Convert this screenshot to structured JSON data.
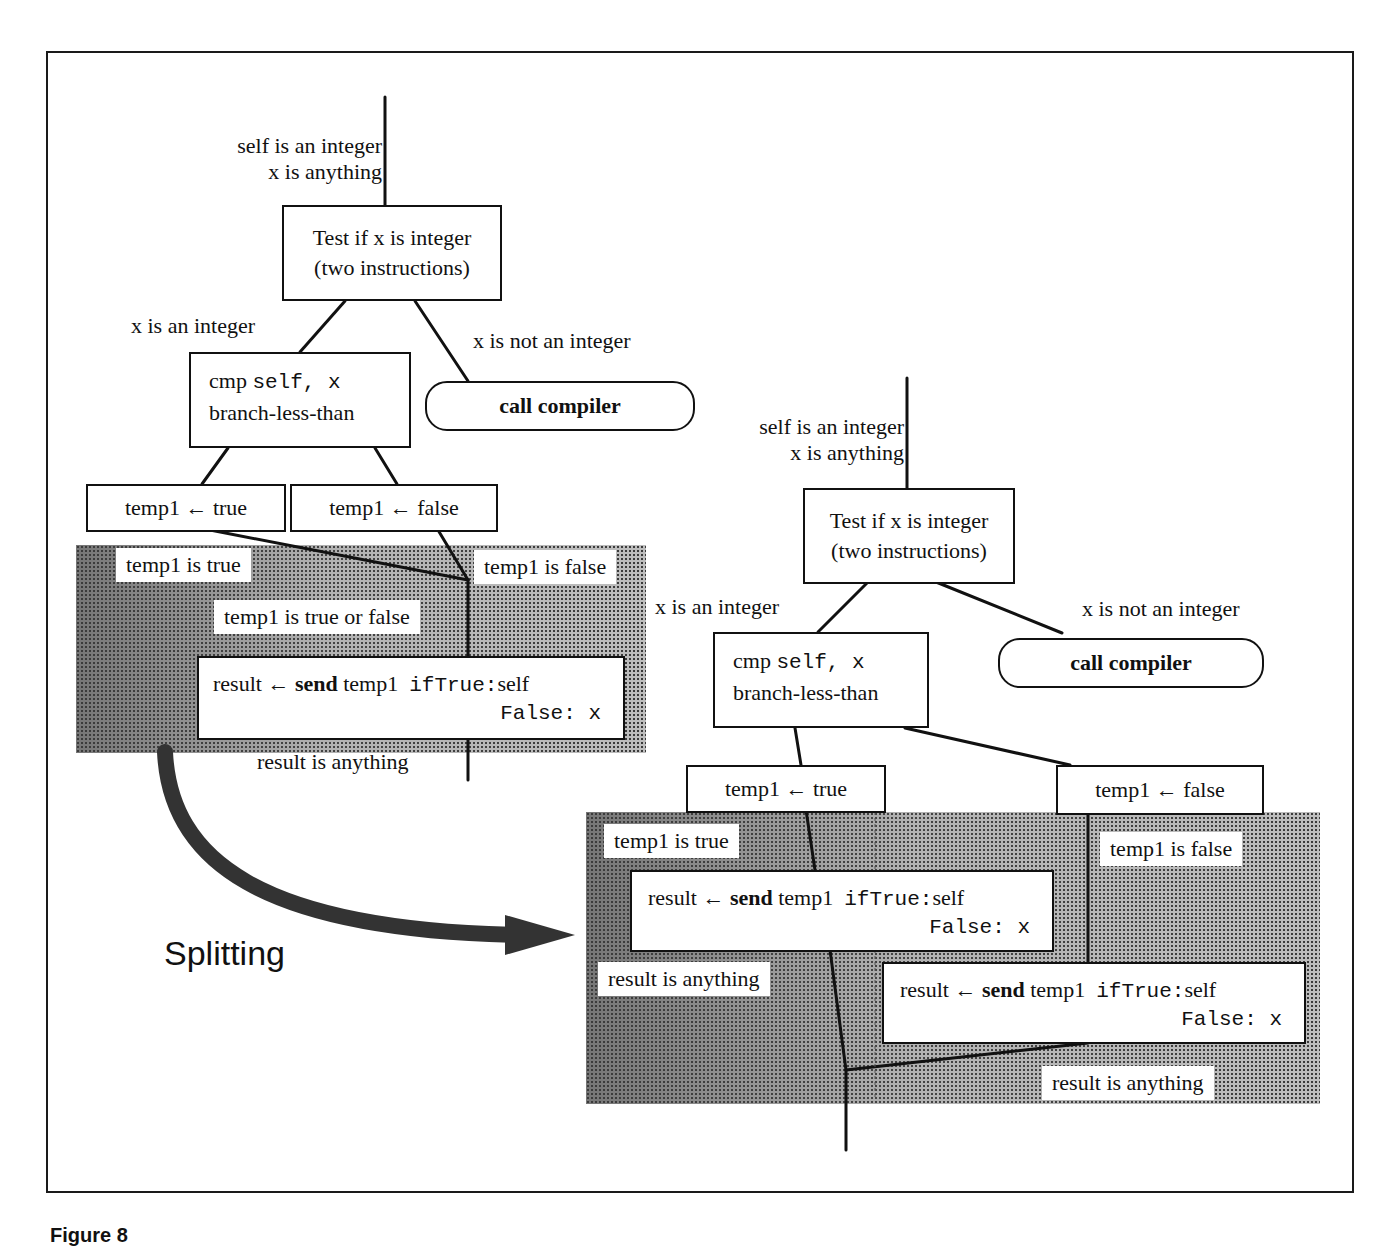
{
  "figure": {
    "caption": "Figure 8",
    "splitting_label": "Splitting"
  },
  "before": {
    "entry_label_1": "self is an integer",
    "entry_label_2": "x is anything",
    "test_box_line1": "Test if x is integer",
    "test_box_line2": "(two instructions)",
    "branch_yes_label": "x is an integer",
    "branch_no_label": "x is not an integer",
    "call_compiler": "call compiler",
    "cmp_box_prefix": "cmp ",
    "cmp_box_args": "self, x",
    "cmp_box_line2": "branch-less-than",
    "temp_true_box": "temp1 ← true",
    "temp_false_box": "temp1 ← false",
    "temp_true_label": "temp1 is true",
    "temp_false_label": "temp1 is false",
    "merge_label": "temp1 is true or false",
    "send_box_result": "result ← ",
    "send_box_send": "send",
    "send_box_receiver": " temp1  ",
    "send_box_selector1": "ifTrue:",
    "send_box_arg1": "self",
    "send_box_selector2": "False: x",
    "exit_label": "result is anything"
  },
  "after": {
    "entry_label_1": "self is an integer",
    "entry_label_2": "x is anything",
    "test_box_line1": "Test if x is integer",
    "test_box_line2": "(two instructions)",
    "branch_yes_label": "x is an integer",
    "branch_no_label": "x is not an integer",
    "call_compiler": "call compiler",
    "cmp_box_prefix": "cmp ",
    "cmp_box_args": "self, x",
    "cmp_box_line2": "branch-less-than",
    "temp_true_box": "temp1 ← true",
    "temp_false_box": "temp1 ← false",
    "temp_true_label": "temp1 is true",
    "temp_false_label": "temp1 is false",
    "send_true_box": {
      "result": "result ← ",
      "send": "send",
      "receiver": " temp1  ",
      "selector1": "ifTrue:",
      "arg1": "self",
      "selector2": "False: x"
    },
    "send_false_box": {
      "result": "result ← ",
      "send": "send",
      "receiver": " temp1  ",
      "selector1": "ifTrue:",
      "arg1": "self",
      "selector2": "False: x"
    },
    "exit_label_left": "result is anything",
    "exit_label_right": "result is anything"
  }
}
